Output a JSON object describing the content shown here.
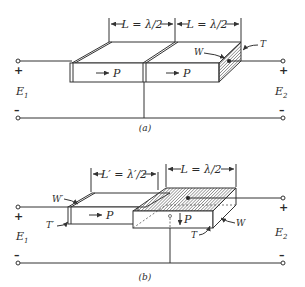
{
  "figure": {
    "panel_a": {
      "caption": "(a)",
      "dim_left": "L = λ/2",
      "dim_right": "L = λ/2",
      "label_W": "W",
      "label_T": "T",
      "polarization_left": "P",
      "polarization_right": "P",
      "input_label": "E",
      "input_sub": "1",
      "output_label": "E",
      "output_sub": "2",
      "plus": "+",
      "minus": "–"
    },
    "panel_b": {
      "caption": "(b)",
      "dim_left": "L′ = λ′/2",
      "dim_right": "L = λ/2",
      "label_W_left": "W′",
      "label_T_left": "T′",
      "label_W_right": "W",
      "label_T_right": "T",
      "polarization_left": "P",
      "polarization_right": "P",
      "input_label": "E",
      "input_sub": "1",
      "output_label": "E",
      "output_sub": "2",
      "plus": "+",
      "minus": "–"
    }
  }
}
